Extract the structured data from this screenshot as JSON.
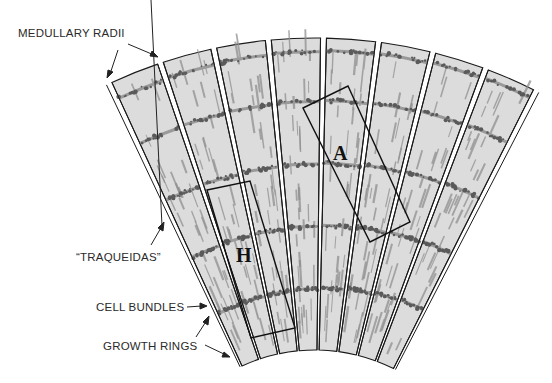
{
  "diagram": {
    "labels": {
      "medullary_radii": "MEDULLARY RADII",
      "traqueidas": "“TRAQUEIDAS”",
      "cell_bundles": "CELL BUNDLES",
      "growth_rings": "GROWTH RINGS"
    },
    "regions": [
      {
        "id": "A",
        "label": "A"
      },
      {
        "id": "H",
        "label": "H"
      }
    ],
    "geometry": {
      "center": [
        315,
        525
      ],
      "inner_radius": 175,
      "outer_radius": 487,
      "start_angle_deg": -25,
      "end_angle_deg": 27,
      "wedge_count": 8,
      "ring_fractions": [
        0.2,
        0.4,
        0.6,
        0.8,
        0.96
      ]
    },
    "colors": {
      "wedge_fill": "#dcdcdc",
      "outline": "#1a1a1a",
      "streak": "#8f8f8f",
      "cell_cluster": "#5a5a5a"
    }
  }
}
